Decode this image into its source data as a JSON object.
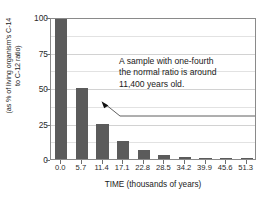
{
  "chart_data": {
    "type": "bar",
    "title": "",
    "xlabel": "TIME (thousands of years)",
    "ylabel": "(as % of living organism's C-14\nto C-12 ratio)",
    "categories": [
      "0.0",
      "5.7",
      "11.4",
      "17.1",
      "22.8",
      "28.5",
      "34.2",
      "39.9",
      "45.6",
      "51.3"
    ],
    "values": [
      100,
      50,
      25,
      12.5,
      6.25,
      3.1,
      1.6,
      0.8,
      0.4,
      0.2
    ],
    "ylim": [
      0,
      100
    ],
    "yticks": [
      0,
      25,
      50,
      75,
      100
    ],
    "ytick_labels": [
      "0",
      "25",
      "50",
      "75",
      "100"
    ],
    "grid": true,
    "gridline_interval": 12.5,
    "legend": "none",
    "bar_color": "#5b5b5b",
    "frame_color": "#8a8a8a",
    "grid_color": "#e2e2e2",
    "annotations": [
      {
        "text": "A sample with one-fourth\nthe normal ratio is around\n11,400 years old.",
        "points_to_category": "11.4",
        "points_to_value": 25
      }
    ]
  },
  "axes": {
    "y_title": "(as % of living organism's C-14\nto C-12 ratio)",
    "x_title": "TIME (thousands of years)",
    "y_tick_labels": [
      "100",
      "75",
      "50",
      "25",
      "0"
    ],
    "x_tick_labels": [
      "0.0",
      "5.7",
      "11.4",
      "17.1",
      "22.8",
      "28.5",
      "34.2",
      "39.9",
      "45.6",
      "51.3"
    ]
  },
  "annotation": {
    "text": "A sample with one-fourth\nthe normal ratio is around\n11,400 years old."
  }
}
